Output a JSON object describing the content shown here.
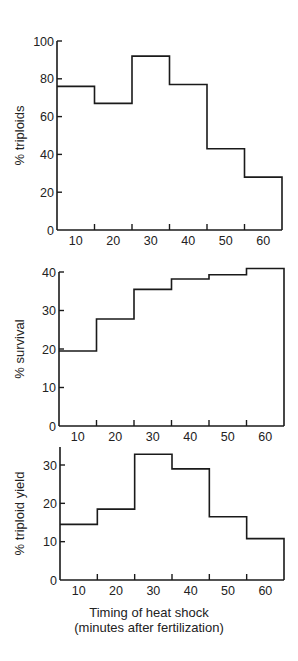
{
  "chart_data": [
    {
      "type": "bar",
      "style": "step-histogram",
      "title": "",
      "xlabel": "",
      "ylabel": "% triploids",
      "categories": [
        "10",
        "20",
        "30",
        "40",
        "50",
        "60"
      ],
      "bin_edges": [
        5,
        15,
        25,
        35,
        45,
        55,
        65
      ],
      "values": [
        76,
        67,
        92,
        77,
        43,
        28
      ],
      "yticks": [
        0,
        20,
        40,
        60,
        80,
        100
      ],
      "ylim": [
        0,
        100
      ],
      "xticks": [
        10,
        20,
        30,
        40,
        50,
        60
      ],
      "grid": false
    },
    {
      "type": "bar",
      "style": "step-histogram",
      "title": "",
      "xlabel": "",
      "ylabel": "% survival",
      "categories": [
        "10",
        "20",
        "30",
        "40",
        "50",
        "60"
      ],
      "bin_edges": [
        5,
        15,
        25,
        35,
        45,
        55,
        65
      ],
      "values": [
        19.5,
        27.8,
        35.5,
        38.2,
        39.3,
        40.9
      ],
      "yticks": [
        0,
        10,
        20,
        30,
        40
      ],
      "ylim": [
        0,
        40
      ],
      "xticks": [
        10,
        20,
        30,
        40,
        50,
        60
      ],
      "grid": false
    },
    {
      "type": "bar",
      "style": "step-histogram",
      "title": "",
      "xlabel": "Timing of heat shock (minutes after fertilization)",
      "ylabel": "% triploid yield",
      "categories": [
        "10",
        "20",
        "30",
        "40",
        "50",
        "60"
      ],
      "bin_edges": [
        5,
        15,
        25,
        35,
        45,
        55,
        65
      ],
      "values": [
        14.5,
        18.5,
        32.8,
        29.0,
        16.5,
        10.8
      ],
      "yticks": [
        0,
        10,
        20,
        30
      ],
      "ylim": [
        0,
        35
      ],
      "xticks": [
        10,
        20,
        30,
        40,
        50,
        60
      ],
      "grid": false
    }
  ],
  "figure": {
    "xaxis_title_line1": "Timing of heat shock",
    "xaxis_title_line2": "(minutes after fertilization)",
    "panels": [
      {
        "x0": 57,
        "x1": 282,
        "yBase": 230,
        "yTopVal": 100,
        "yTopPx": 41,
        "axisTopPx": 41
      },
      {
        "x0": 59,
        "x1": 284,
        "yBase": 426,
        "yTopVal": 40,
        "yTopPx": 272,
        "axisTopPx": 272
      },
      {
        "x0": 60,
        "x1": 284,
        "yBase": 580,
        "yTopVal": 30,
        "yTopPx": 465,
        "axisTopPx": 447
      }
    ]
  }
}
